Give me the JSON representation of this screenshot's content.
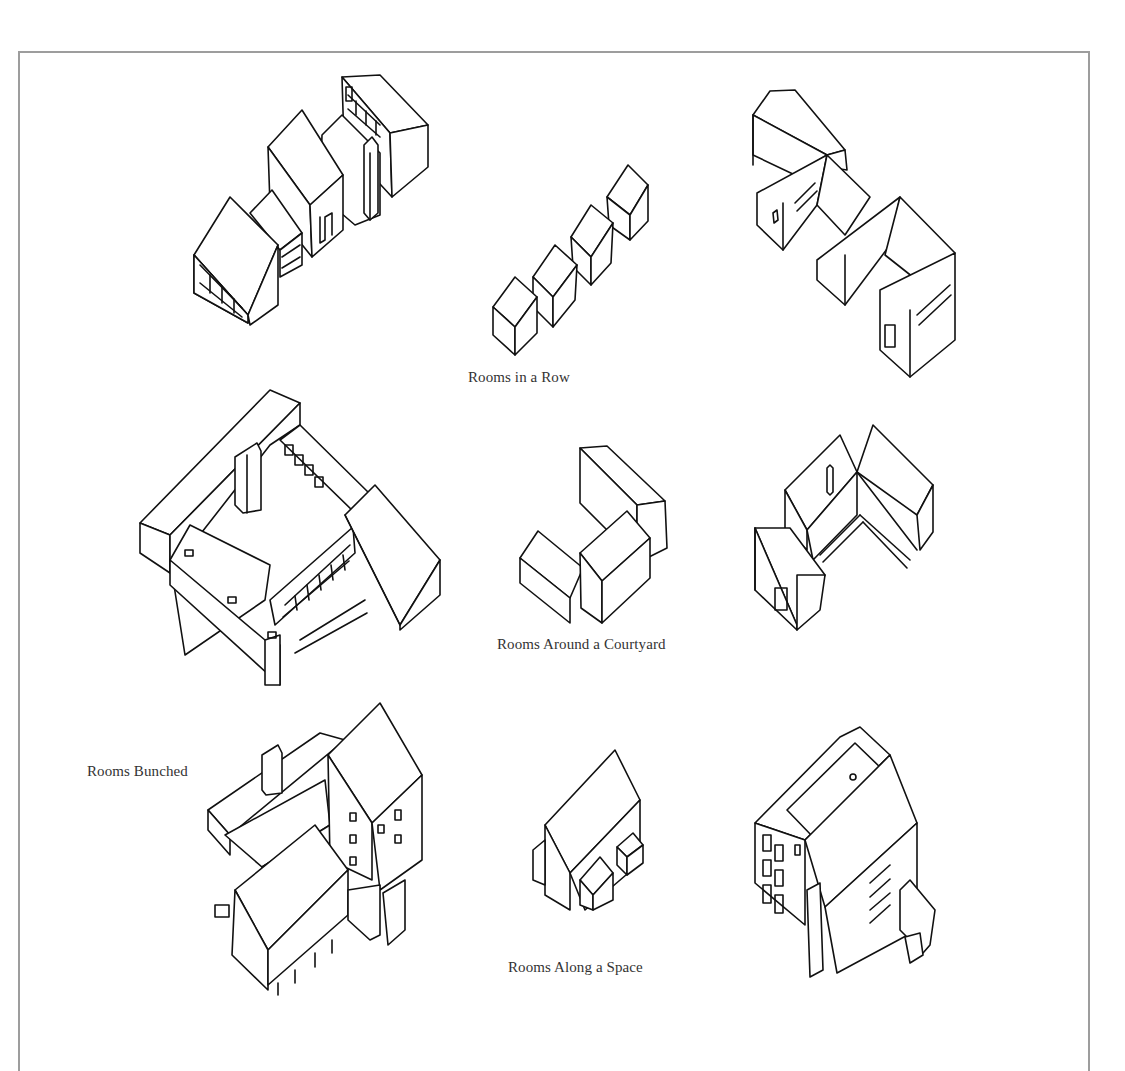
{
  "figure": {
    "frame_color": "#9d9d9d",
    "line_color": "#111111",
    "caption_color": "#333333",
    "captions": {
      "row": "Rooms in a Row",
      "courtyard": "Rooms Around a Courtyard",
      "bunched": "Rooms Bunched",
      "along_space": "Rooms Along a Space"
    },
    "drawings": [
      {
        "group": "Rooms in a Row",
        "position": "left",
        "subject": "isometric row of gabled houses with chimney and windows"
      },
      {
        "group": "Rooms in a Row",
        "position": "center",
        "subject": "diagram of five box volumes in a diagonal row"
      },
      {
        "group": "Rooms in a Row",
        "position": "right",
        "subject": "isometric staggered row of gabled houses"
      },
      {
        "group": "Rooms Around a Courtyard",
        "position": "left",
        "subject": "isometric flat-roofed buildings enclosing a square courtyard"
      },
      {
        "group": "Rooms Around a Courtyard",
        "position": "center",
        "subject": "diagram of three gabled volumes forming a U"
      },
      {
        "group": "Rooms Around a Courtyard",
        "position": "right",
        "subject": "isometric gabled houses around a courtyard"
      },
      {
        "group": "Rooms Bunched",
        "position": "left",
        "subject": "isometric cluster of buildings on stilts with chimney"
      },
      {
        "group": "Rooms Along a Space",
        "position": "center",
        "subject": "diagram of gabled volume with two small attached bays"
      },
      {
        "group": "Rooms Along a Space",
        "position": "right",
        "subject": "isometric tall house with roof terrace and exterior stair"
      }
    ]
  }
}
